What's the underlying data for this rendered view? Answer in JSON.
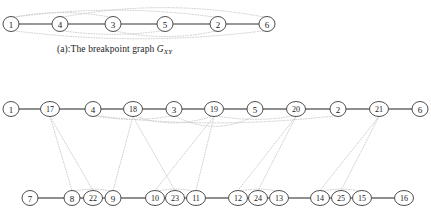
{
  "figure": {
    "title_caption_a": "(a):The breakpoint graph ",
    "caption_a_symbol": "G",
    "caption_a_subscript": "XY",
    "colors": {
      "solid_edge": "#333333",
      "dotted_edge": "#c9c9c9",
      "node_stroke": "#3b3b3b",
      "node_fill": "#ffffff",
      "label_text": "#202020",
      "background": "#ffffff"
    }
  },
  "graph_a": {
    "name": "breakpoint-graph-GXY",
    "nodes": [
      {
        "label": "1",
        "x": 11,
        "y": 24
      },
      {
        "label": "4",
        "x": 60,
        "y": 24
      },
      {
        "label": "3",
        "x": 113,
        "y": 24
      },
      {
        "label": "5",
        "x": 165,
        "y": 24
      },
      {
        "label": "2",
        "x": 218,
        "y": 24
      },
      {
        "label": "6",
        "x": 267,
        "y": 24
      }
    ],
    "solid_edges": [
      {
        "from": "1",
        "to": "4"
      },
      {
        "from": "4",
        "to": "3"
      },
      {
        "from": "3",
        "to": "5"
      },
      {
        "from": "5",
        "to": "2"
      },
      {
        "from": "2",
        "to": "6"
      }
    ],
    "dotted_arcs_above": [
      {
        "from": "1",
        "to": "3"
      },
      {
        "from": "1",
        "to": "2"
      },
      {
        "from": "4",
        "to": "6"
      }
    ],
    "dotted_arcs_below": [
      {
        "from": "4",
        "to": "5"
      },
      {
        "from": "3",
        "to": "2"
      },
      {
        "from": "1",
        "to": "6"
      }
    ]
  },
  "graph_b": {
    "name": "expanded-breakpoint-graph",
    "middle_row": [
      {
        "label": "1",
        "x": 11,
        "y": 109
      },
      {
        "label": "17",
        "x": 50,
        "y": 109
      },
      {
        "label": "4",
        "x": 93,
        "y": 109
      },
      {
        "label": "18",
        "x": 133,
        "y": 109
      },
      {
        "label": "3",
        "x": 174,
        "y": 109
      },
      {
        "label": "19",
        "x": 214,
        "y": 109
      },
      {
        "label": "5",
        "x": 255,
        "y": 109
      },
      {
        "label": "20",
        "x": 296,
        "y": 109
      },
      {
        "label": "2",
        "x": 338,
        "y": 109
      },
      {
        "label": "21",
        "x": 379,
        "y": 109
      },
      {
        "label": "6",
        "x": 420,
        "y": 109
      }
    ],
    "bottom_row": [
      {
        "label": "7",
        "x": 30,
        "y": 198
      },
      {
        "label": "8",
        "x": 72,
        "y": 198
      },
      {
        "label": "22",
        "x": 93,
        "y": 198
      },
      {
        "label": "9",
        "x": 113,
        "y": 198
      },
      {
        "label": "10",
        "x": 155,
        "y": 198
      },
      {
        "label": "23",
        "x": 175,
        "y": 198
      },
      {
        "label": "11",
        "x": 196,
        "y": 198
      },
      {
        "label": "12",
        "x": 238,
        "y": 198
      },
      {
        "label": "24",
        "x": 258,
        "y": 198
      },
      {
        "label": "13",
        "x": 279,
        "y": 198
      },
      {
        "label": "14",
        "x": 320,
        "y": 198
      },
      {
        "label": "25",
        "x": 341,
        "y": 198
      },
      {
        "label": "15",
        "x": 362,
        "y": 198
      },
      {
        "label": "16",
        "x": 404,
        "y": 198
      }
    ],
    "middle_solid_edges": [
      {
        "from": "1",
        "to": "17"
      },
      {
        "from": "17",
        "to": "4"
      },
      {
        "from": "4",
        "to": "18"
      },
      {
        "from": "18",
        "to": "3"
      },
      {
        "from": "3",
        "to": "19"
      },
      {
        "from": "19",
        "to": "5"
      },
      {
        "from": "5",
        "to": "20"
      },
      {
        "from": "20",
        "to": "2"
      },
      {
        "from": "2",
        "to": "21"
      },
      {
        "from": "21",
        "to": "6"
      }
    ],
    "bottom_solid_edges": [
      {
        "from": "7",
        "to": "8"
      },
      {
        "from": "8",
        "to": "22"
      },
      {
        "from": "22",
        "to": "9"
      },
      {
        "from": "9",
        "to": "10"
      },
      {
        "from": "10",
        "to": "23"
      },
      {
        "from": "23",
        "to": "11"
      },
      {
        "from": "11",
        "to": "12"
      },
      {
        "from": "12",
        "to": "24"
      },
      {
        "from": "24",
        "to": "13"
      },
      {
        "from": "13",
        "to": "14"
      },
      {
        "from": "14",
        "to": "25"
      },
      {
        "from": "25",
        "to": "15"
      },
      {
        "from": "15",
        "to": "16"
      }
    ],
    "vertical_dotted_edges": [
      {
        "from": "17",
        "to": "8"
      },
      {
        "from": "17",
        "to": "22"
      },
      {
        "from": "18",
        "to": "9"
      },
      {
        "from": "18",
        "to": "23"
      },
      {
        "from": "19",
        "to": "10"
      },
      {
        "from": "19",
        "to": "11"
      },
      {
        "from": "20",
        "to": "12"
      },
      {
        "from": "20",
        "to": "24"
      },
      {
        "from": "21",
        "to": "14"
      },
      {
        "from": "21",
        "to": "25"
      }
    ],
    "bottom_small_arcs": [
      {
        "from": "8",
        "to": "9"
      },
      {
        "from": "10",
        "to": "11"
      },
      {
        "from": "12",
        "to": "13"
      },
      {
        "from": "14",
        "to": "15"
      }
    ],
    "middle_dotted_arcs": [
      {
        "from": "4",
        "to": "3"
      },
      {
        "from": "18",
        "to": "19"
      },
      {
        "from": "3",
        "to": "5"
      },
      {
        "from": "19",
        "to": "20"
      },
      {
        "from": "4",
        "to": "2"
      }
    ]
  }
}
